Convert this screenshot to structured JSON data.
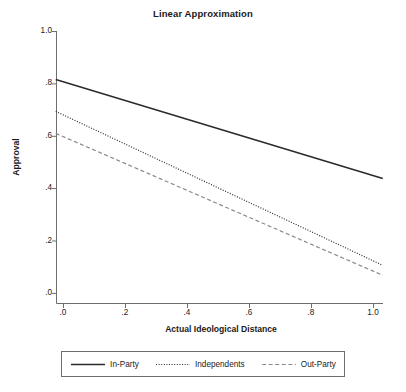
{
  "chart_data": {
    "type": "line",
    "title": "Linear Approximation",
    "xlabel": "Actual Ideological Distance",
    "ylabel": "Approval",
    "xlim": [
      0.0,
      1.0
    ],
    "ylim": [
      0.0,
      1.0
    ],
    "grid": false,
    "legend_position": "bottom",
    "xticks": [
      ".0",
      ".2",
      ".4",
      ".6",
      ".8",
      "1.0"
    ],
    "xtick_values": [
      0.0,
      0.2,
      0.4,
      0.6,
      0.8,
      1.0
    ],
    "yticks": [
      "1.0",
      ".8",
      ".6",
      ".4",
      ".2",
      ".0"
    ],
    "ytick_values": [
      1.0,
      0.8,
      0.6,
      0.4,
      0.2,
      0.0
    ],
    "x": [
      -0.025,
      1.03
    ],
    "series": [
      {
        "name": "In-Party",
        "style": "solid",
        "color": "#2b2b2b",
        "values": [
          0.817,
          0.439
        ]
      },
      {
        "name": "Independents",
        "style": "dotted",
        "color": "#2b2b2b",
        "values": [
          0.695,
          0.107
        ]
      },
      {
        "name": "Out-Party",
        "style": "dashed",
        "color": "#8a8a8a",
        "values": [
          0.611,
          0.069
        ]
      }
    ]
  },
  "legend": {
    "items": [
      {
        "label": "In-Party",
        "style": "solid"
      },
      {
        "label": "Independents",
        "style": "dotted"
      },
      {
        "label": "Out-Party",
        "style": "dashed"
      }
    ]
  },
  "colors": {
    "axis": "#6d6d6d",
    "text": "#1a1a1a",
    "in_party": "#2b2b2b",
    "independents": "#2b2b2b",
    "out_party": "#8a8a8a"
  }
}
